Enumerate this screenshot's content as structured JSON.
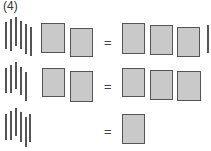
{
  "problem_label": "(4)",
  "equals": "=",
  "rows": [
    {
      "left_sticks": 6,
      "left_boxes": 2,
      "right_boxes": 3,
      "right_sticks": 1
    },
    {
      "left_sticks": 5,
      "left_boxes": 2,
      "right_boxes": 3,
      "right_sticks": 0
    },
    {
      "left_sticks": 5,
      "left_boxes": 0,
      "right_boxes": 1,
      "right_sticks": 0
    }
  ]
}
